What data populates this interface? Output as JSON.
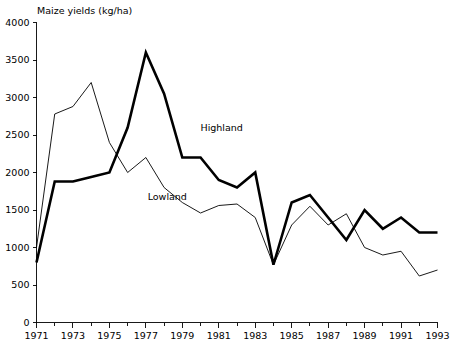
{
  "chart_data": {
    "type": "line",
    "title": "Maize yields (kg/ha)",
    "xlabel": "",
    "ylabel": "Maize yields (kg/ha)",
    "xlim": [
      1971,
      1993
    ],
    "ylim": [
      0,
      4000
    ],
    "grid": false,
    "legend_position": "inline-annotation",
    "x": [
      1971,
      1972,
      1973,
      1974,
      1975,
      1976,
      1977,
      1978,
      1979,
      1980,
      1981,
      1982,
      1983,
      1984,
      1985,
      1986,
      1987,
      1988,
      1989,
      1990,
      1991,
      1992,
      1993
    ],
    "y_ticks": [
      0,
      500,
      1000,
      1500,
      2000,
      2500,
      3000,
      3500,
      4000
    ],
    "y_tick_labels": [
      "0",
      "500",
      "1000",
      "1500",
      "2000",
      "2500",
      "3000",
      "3500",
      "4000"
    ],
    "x_ticks": [
      1971,
      1973,
      1975,
      1977,
      1979,
      1981,
      1983,
      1985,
      1987,
      1989,
      1991,
      1993
    ],
    "x_tick_labels": [
      "1971",
      "1973",
      "1975",
      "1977",
      "1979",
      "1981",
      "1983",
      "1985",
      "1987",
      "1989",
      "1991",
      "1993"
    ],
    "x_minor_ticks": [
      1972,
      1974,
      1976,
      1978,
      1980,
      1982,
      1984,
      1986,
      1988,
      1990,
      1992
    ],
    "series": [
      {
        "name": "Highland",
        "style": "thick",
        "color": "#000000",
        "stroke_width": 2.6,
        "label_x": 1980,
        "label_y": 2560,
        "values": [
          800,
          1880,
          1880,
          1940,
          2000,
          2600,
          3600,
          3050,
          2200,
          2200,
          1900,
          1800,
          2000,
          770,
          1600,
          1700,
          1400,
          1100,
          1500,
          1250,
          1400,
          1200,
          1200
        ]
      },
      {
        "name": "Lowland",
        "style": "thin",
        "color": "#000000",
        "stroke_width": 0.9,
        "label_x": 1977.1,
        "label_y": 1640,
        "values": [
          1000,
          2780,
          2880,
          3200,
          2400,
          2000,
          2200,
          1800,
          1600,
          1460,
          1560,
          1580,
          1400,
          770,
          1300,
          1550,
          1300,
          1450,
          1000,
          900,
          950,
          620,
          700
        ]
      }
    ]
  },
  "annotations": {
    "highland_label": "Highland",
    "lowland_label": "Lowland"
  },
  "style": {
    "background": "#ffffff",
    "axis_color": "#000000",
    "text_color": "#000000"
  }
}
